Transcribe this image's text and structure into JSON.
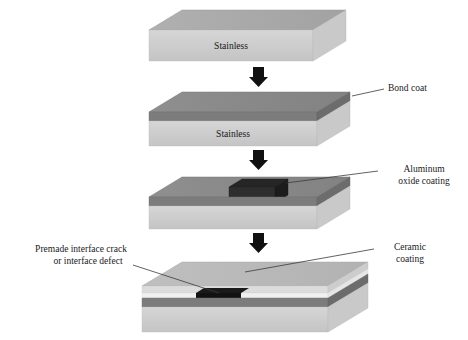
{
  "figure": {
    "type": "process-diagram",
    "background_color": "#ffffff",
    "orientation": "vertical-sequence",
    "step_count": 4
  },
  "palette": {
    "stainless_top": "#a9a9a9",
    "stainless_front": "#cfcfcf",
    "stainless_side": "#bdbdbd",
    "bond_coat_top": "#8a8a8a",
    "bond_coat_front": "#7e7e7e",
    "bond_coat_side": "#6f6f6f",
    "alumina_patch": "#2b2b2b",
    "alumina_patch_side": "#1f1f1f",
    "ceramic_top": "#b8b8b8",
    "ceramic_front": "#d8d8d8",
    "white_band": "#f2f2f2",
    "crack_black": "#121212",
    "arrow_black": "#111111",
    "leader_line": "#3a3a3a",
    "text_color": "#1a1a1a"
  },
  "steps": [
    {
      "index": 1,
      "name": "bare-substrate",
      "block_label": "Stainless",
      "layers": [
        "Stainless"
      ]
    },
    {
      "index": 2,
      "name": "bond-coated-substrate",
      "block_label": "Stainless",
      "layers": [
        "Bond coat",
        "Stainless"
      ]
    },
    {
      "index": 3,
      "name": "alumina-patch-applied",
      "block_label": "",
      "layers": [
        "Aluminum oxide coating",
        "Bond coat",
        "Stainless"
      ]
    },
    {
      "index": 4,
      "name": "ceramic-topcoat-with-defect",
      "block_label": "",
      "layers": [
        "Ceramic coating",
        "Bond coat",
        "Stainless"
      ]
    }
  ],
  "callouts": {
    "bond_coat": {
      "text": "Bond coat",
      "lines": [
        "Bond coat"
      ],
      "align": "left",
      "points_to": "step-2-bond-coat-layer"
    },
    "aluminum_oxide": {
      "text": "Aluminum oxide coating",
      "lines": [
        "Aluminum",
        "oxide coating"
      ],
      "align": "center",
      "points_to": "step-3-alumina-patch"
    },
    "ceramic_coating": {
      "text": "Ceramic coating",
      "lines": [
        "Ceramic",
        "coating"
      ],
      "align": "center",
      "points_to": "step-4-ceramic-layer"
    },
    "premade_crack": {
      "text": "Premade interface crack or interface defect",
      "lines": [
        "Premade interface crack",
        "or interface defect"
      ],
      "align": "center",
      "points_to": "step-4-interface-crack"
    }
  },
  "block_labels": {
    "step1": "Stainless",
    "step2": "Stainless"
  },
  "arrows": [
    {
      "name": "arrow-step1-to-step2",
      "direction": "down"
    },
    {
      "name": "arrow-step2-to-step3",
      "direction": "down"
    },
    {
      "name": "arrow-step3-to-step4",
      "direction": "down"
    }
  ]
}
